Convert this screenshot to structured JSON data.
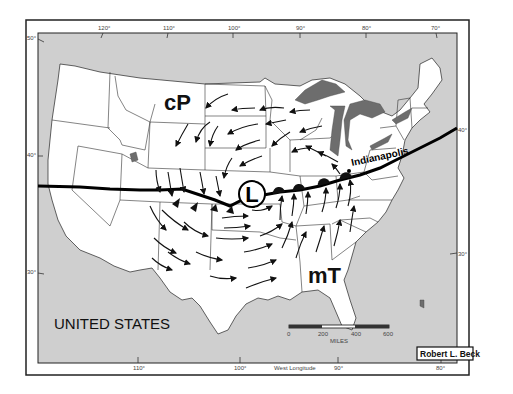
{
  "map": {
    "title_label": "UNITED STATES",
    "air_masses": [
      {
        "label": "cP",
        "name": "continental polar"
      },
      {
        "label": "mT",
        "name": "maritime tropical"
      }
    ],
    "low_pressure_symbol": "L",
    "city_label": "Indianapolis",
    "credit": "Robert L. Beck",
    "axis_label_bottom": "West Longitude",
    "longitude_ticks_top": [
      "120°",
      "110°",
      "100°",
      "90°",
      "80°",
      "70°"
    ],
    "longitude_ticks_bottom": [
      "110°",
      "100°",
      "90°",
      "80°"
    ],
    "latitude_ticks_left": [
      "50°",
      "40°",
      "30°"
    ],
    "latitude_ticks_right": [
      "40°",
      "30°"
    ],
    "scale_bar": {
      "ticks": [
        "0",
        "200",
        "400",
        "600"
      ],
      "unit": "MILES"
    },
    "fronts": [
      {
        "type": "cold-front",
        "position": "west of low, triangles pointing south"
      },
      {
        "type": "warm-front",
        "position": "east of low toward Indianapolis, semicircles pointing north"
      },
      {
        "type": "stationary-line",
        "position": "extends west to Pacific and east to Atlantic"
      }
    ],
    "colors": {
      "land": "#ffffff",
      "water": "#cfcfcf",
      "lakes": "#6d6d6d",
      "lines": "#000000"
    }
  }
}
